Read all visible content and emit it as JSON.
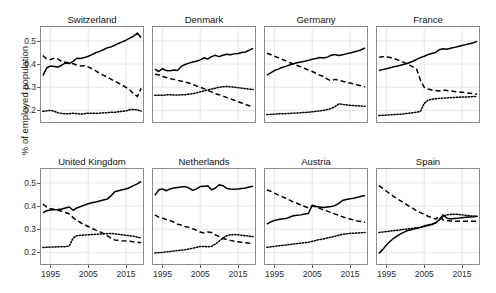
{
  "chart_data": {
    "type": "line",
    "title": "",
    "subtitle": "",
    "xlabel": "",
    "ylabel": "% of employed population",
    "xlim": [
      1992.5,
      2019.5
    ],
    "ylim": [
      0.15,
      0.56
    ],
    "grid": true,
    "legend_position": "none",
    "facet_layout": "2 rows x 4 columns",
    "x_ticks": [
      1995,
      2005,
      2015
    ],
    "x_tick_labels": [
      "1995",
      "2005",
      "2015"
    ],
    "y_ticks": [
      0.2,
      0.3,
      0.4,
      0.5
    ],
    "y_tick_labels": [
      "0.2",
      "0.3",
      "0.4",
      "0.5"
    ],
    "line_styles": {
      "series_1": "solid",
      "series_2": "dashed",
      "series_3": "dotted"
    },
    "colors": {
      "line": "#000000",
      "panel_border": "#8c8c8c",
      "gridline": "#e8e8e8",
      "background": "#ffffff",
      "text": "#1a1a1a"
    },
    "x": [
      1993,
      1994,
      1995,
      1996,
      1997,
      1998,
      1999,
      2000,
      2001,
      2002,
      2003,
      2004,
      2005,
      2006,
      2007,
      2008,
      2009,
      2010,
      2011,
      2012,
      2013,
      2014,
      2015,
      2016,
      2017,
      2018,
      2019
    ],
    "panels": [
      {
        "name": "Switzerland",
        "row": 0,
        "col": 0,
        "series": [
          {
            "name": "series_1",
            "style": "solid",
            "values": [
              0.35,
              0.383,
              0.392,
              0.39,
              0.387,
              0.395,
              0.405,
              0.402,
              0.412,
              0.425,
              0.424,
              0.428,
              0.434,
              0.441,
              0.449,
              0.455,
              0.462,
              0.47,
              0.474,
              0.481,
              0.489,
              0.496,
              0.503,
              0.512,
              0.52,
              0.534,
              0.515
            ]
          },
          {
            "name": "series_2",
            "style": "dashed",
            "values": [
              0.437,
              0.421,
              0.42,
              0.425,
              0.422,
              0.41,
              0.408,
              0.405,
              0.401,
              0.396,
              0.392,
              0.393,
              0.388,
              0.38,
              0.371,
              0.36,
              0.352,
              0.344,
              0.335,
              0.326,
              0.318,
              0.309,
              0.299,
              0.288,
              0.272,
              0.26,
              0.295
            ]
          },
          {
            "name": "series_3",
            "style": "dotted",
            "values": [
              0.196,
              0.198,
              0.2,
              0.196,
              0.19,
              0.187,
              0.185,
              0.186,
              0.188,
              0.186,
              0.184,
              0.186,
              0.188,
              0.188,
              0.187,
              0.188,
              0.19,
              0.19,
              0.192,
              0.192,
              0.194,
              0.196,
              0.198,
              0.203,
              0.204,
              0.202,
              0.197
            ]
          }
        ]
      },
      {
        "name": "Denmark",
        "row": 0,
        "col": 1,
        "series": [
          {
            "name": "series_1",
            "style": "solid",
            "values": [
              0.378,
              0.368,
              0.38,
              0.372,
              0.371,
              0.374,
              0.372,
              0.39,
              0.398,
              0.404,
              0.409,
              0.412,
              0.418,
              0.427,
              0.422,
              0.432,
              0.438,
              0.432,
              0.438,
              0.442,
              0.44,
              0.444,
              0.446,
              0.45,
              0.452,
              0.46,
              0.468
            ]
          },
          {
            "name": "series_2",
            "style": "dashed",
            "values": [
              0.356,
              0.354,
              0.346,
              0.342,
              0.337,
              0.334,
              0.33,
              0.326,
              0.322,
              0.318,
              0.312,
              0.306,
              0.3,
              0.294,
              0.286,
              0.28,
              0.272,
              0.268,
              0.262,
              0.256,
              0.25,
              0.244,
              0.238,
              0.232,
              0.226,
              0.22,
              0.214
            ]
          },
          {
            "name": "series_3",
            "style": "dotted",
            "values": [
              0.265,
              0.266,
              0.265,
              0.267,
              0.268,
              0.266,
              0.266,
              0.267,
              0.268,
              0.27,
              0.272,
              0.276,
              0.28,
              0.284,
              0.288,
              0.292,
              0.296,
              0.3,
              0.302,
              0.303,
              0.302,
              0.3,
              0.298,
              0.296,
              0.294,
              0.292,
              0.29
            ]
          }
        ]
      },
      {
        "name": "Germany",
        "row": 0,
        "col": 2,
        "series": [
          {
            "name": "series_1",
            "style": "solid",
            "values": [
              0.352,
              0.362,
              0.372,
              0.378,
              0.385,
              0.39,
              0.396,
              0.401,
              0.406,
              0.409,
              0.412,
              0.416,
              0.421,
              0.424,
              0.428,
              0.426,
              0.43,
              0.438,
              0.441,
              0.437,
              0.44,
              0.444,
              0.448,
              0.452,
              0.456,
              0.462,
              0.47
            ]
          },
          {
            "name": "series_2",
            "style": "dashed",
            "values": [
              0.447,
              0.441,
              0.434,
              0.428,
              0.421,
              0.414,
              0.407,
              0.4,
              0.394,
              0.388,
              0.381,
              0.374,
              0.368,
              0.36,
              0.352,
              0.347,
              0.335,
              0.328,
              0.334,
              0.33,
              0.326,
              0.322,
              0.318,
              0.314,
              0.31,
              0.306,
              0.301
            ]
          },
          {
            "name": "series_3",
            "style": "dotted",
            "values": [
              0.182,
              0.183,
              0.184,
              0.185,
              0.186,
              0.186,
              0.187,
              0.188,
              0.189,
              0.19,
              0.191,
              0.192,
              0.194,
              0.196,
              0.198,
              0.2,
              0.204,
              0.208,
              0.216,
              0.228,
              0.226,
              0.224,
              0.222,
              0.221,
              0.22,
              0.219,
              0.218
            ]
          }
        ]
      },
      {
        "name": "France",
        "row": 0,
        "col": 3,
        "series": [
          {
            "name": "series_1",
            "style": "solid",
            "values": [
              0.372,
              0.376,
              0.38,
              0.384,
              0.388,
              0.392,
              0.396,
              0.4,
              0.406,
              0.412,
              0.42,
              0.428,
              0.434,
              0.441,
              0.446,
              0.45,
              0.462,
              0.466,
              0.464,
              0.468,
              0.472,
              0.476,
              0.48,
              0.484,
              0.488,
              0.492,
              0.498
            ]
          },
          {
            "name": "series_2",
            "style": "dashed",
            "values": [
              0.43,
              0.432,
              0.431,
              0.428,
              0.424,
              0.418,
              0.412,
              0.404,
              0.396,
              0.388,
              0.378,
              0.33,
              0.3,
              0.292,
              0.288,
              0.286,
              0.284,
              0.288,
              0.286,
              0.284,
              0.282,
              0.28,
              0.278,
              0.276,
              0.274,
              0.272,
              0.27
            ]
          },
          {
            "name": "series_3",
            "style": "dotted",
            "values": [
              0.178,
              0.179,
              0.18,
              0.181,
              0.182,
              0.183,
              0.184,
              0.186,
              0.188,
              0.19,
              0.192,
              0.196,
              0.23,
              0.244,
              0.248,
              0.25,
              0.252,
              0.253,
              0.254,
              0.255,
              0.256,
              0.257,
              0.258,
              0.258,
              0.259,
              0.26,
              0.26
            ]
          }
        ]
      },
      {
        "name": "United Kingdom",
        "row": 1,
        "col": 0,
        "series": [
          {
            "name": "series_1",
            "style": "solid",
            "values": [
              0.372,
              0.38,
              0.383,
              0.384,
              0.385,
              0.387,
              0.392,
              0.396,
              0.382,
              0.392,
              0.398,
              0.404,
              0.41,
              0.414,
              0.418,
              0.422,
              0.426,
              0.43,
              0.444,
              0.462,
              0.466,
              0.47,
              0.474,
              0.48,
              0.488,
              0.496,
              0.506
            ]
          },
          {
            "name": "series_2",
            "style": "dashed",
            "values": [
              0.408,
              0.396,
              0.388,
              0.386,
              0.382,
              0.378,
              0.372,
              0.366,
              0.35,
              0.338,
              0.328,
              0.32,
              0.312,
              0.304,
              0.296,
              0.29,
              0.282,
              0.272,
              0.262,
              0.254,
              0.252,
              0.25,
              0.249,
              0.248,
              0.246,
              0.244,
              0.242
            ]
          },
          {
            "name": "series_3",
            "style": "dotted",
            "values": [
              0.221,
              0.222,
              0.223,
              0.223,
              0.224,
              0.224,
              0.225,
              0.228,
              0.262,
              0.272,
              0.274,
              0.275,
              0.276,
              0.277,
              0.278,
              0.279,
              0.28,
              0.281,
              0.282,
              0.28,
              0.278,
              0.276,
              0.274,
              0.272,
              0.27,
              0.266,
              0.262
            ]
          }
        ]
      },
      {
        "name": "Netherlands",
        "row": 1,
        "col": 1,
        "series": [
          {
            "name": "series_1",
            "style": "solid",
            "values": [
              0.446,
              0.47,
              0.474,
              0.466,
              0.474,
              0.478,
              0.48,
              0.482,
              0.484,
              0.478,
              0.468,
              0.474,
              0.484,
              0.486,
              0.488,
              0.47,
              0.478,
              0.492,
              0.488,
              0.476,
              0.474,
              0.473,
              0.474,
              0.476,
              0.478,
              0.482,
              0.486
            ]
          },
          {
            "name": "series_2",
            "style": "dashed",
            "values": [
              0.362,
              0.352,
              0.348,
              0.342,
              0.338,
              0.33,
              0.322,
              0.318,
              0.312,
              0.308,
              0.302,
              0.296,
              0.288,
              0.284,
              0.288,
              0.286,
              0.276,
              0.268,
              0.26,
              0.256,
              0.252,
              0.248,
              0.246,
              0.244,
              0.242,
              0.24,
              0.238
            ]
          },
          {
            "name": "series_3",
            "style": "dotted",
            "values": [
              0.198,
              0.199,
              0.2,
              0.202,
              0.204,
              0.206,
              0.208,
              0.21,
              0.212,
              0.215,
              0.218,
              0.222,
              0.225,
              0.226,
              0.224,
              0.226,
              0.236,
              0.248,
              0.262,
              0.272,
              0.276,
              0.277,
              0.276,
              0.274,
              0.272,
              0.27,
              0.268
            ]
          }
        ]
      },
      {
        "name": "Austria",
        "row": 1,
        "col": 2,
        "series": [
          {
            "name": "series_1",
            "style": "solid",
            "values": [
              0.322,
              0.332,
              0.338,
              0.342,
              0.344,
              0.346,
              0.352,
              0.358,
              0.36,
              0.362,
              0.366,
              0.368,
              0.404,
              0.398,
              0.396,
              0.394,
              0.396,
              0.398,
              0.402,
              0.412,
              0.424,
              0.428,
              0.432,
              0.434,
              0.438,
              0.442,
              0.446
            ]
          },
          {
            "name": "series_2",
            "style": "dashed",
            "values": [
              0.47,
              0.464,
              0.456,
              0.448,
              0.441,
              0.434,
              0.426,
              0.418,
              0.412,
              0.404,
              0.398,
              0.392,
              0.4,
              0.396,
              0.39,
              0.384,
              0.378,
              0.372,
              0.366,
              0.36,
              0.354,
              0.348,
              0.344,
              0.34,
              0.336,
              0.333,
              0.33
            ]
          },
          {
            "name": "series_3",
            "style": "dotted",
            "values": [
              0.222,
              0.224,
              0.226,
              0.228,
              0.23,
              0.232,
              0.234,
              0.236,
              0.238,
              0.24,
              0.242,
              0.244,
              0.248,
              0.252,
              0.256,
              0.258,
              0.262,
              0.266,
              0.27,
              0.274,
              0.278,
              0.28,
              0.282,
              0.283,
              0.284,
              0.285,
              0.286
            ]
          }
        ]
      },
      {
        "name": "Spain",
        "row": 1,
        "col": 3,
        "series": [
          {
            "name": "series_1",
            "style": "solid",
            "values": [
              0.195,
              0.212,
              0.232,
              0.248,
              0.262,
              0.272,
              0.282,
              0.29,
              0.296,
              0.3,
              0.304,
              0.308,
              0.314,
              0.318,
              0.322,
              0.328,
              0.342,
              0.362,
              0.348,
              0.344,
              0.346,
              0.348,
              0.35,
              0.352,
              0.353,
              0.354,
              0.356
            ]
          },
          {
            "name": "series_2",
            "style": "dashed",
            "values": [
              0.488,
              0.476,
              0.464,
              0.452,
              0.441,
              0.43,
              0.42,
              0.41,
              0.4,
              0.39,
              0.38,
              0.372,
              0.364,
              0.356,
              0.35,
              0.344,
              0.356,
              0.34,
              0.338,
              0.336,
              0.335,
              0.334,
              0.334,
              0.334,
              0.334,
              0.334,
              0.334
            ]
          },
          {
            "name": "series_3",
            "style": "dotted",
            "values": [
              0.286,
              0.288,
              0.29,
              0.292,
              0.294,
              0.296,
              0.298,
              0.3,
              0.302,
              0.304,
              0.306,
              0.308,
              0.312,
              0.316,
              0.32,
              0.326,
              0.34,
              0.356,
              0.362,
              0.364,
              0.365,
              0.364,
              0.362,
              0.36,
              0.358,
              0.357,
              0.356
            ]
          }
        ]
      }
    ]
  }
}
